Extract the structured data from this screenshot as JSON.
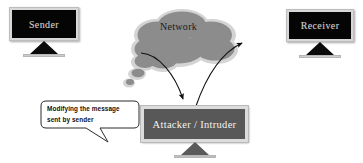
{
  "diagram": {
    "background_color": "#ffffff",
    "nodes": {
      "sender": {
        "label": "Sender",
        "type": "computer-monitor",
        "screen_color": "#050505",
        "bezel_color": "#d8d8d8",
        "text_color": "#cfcfcf"
      },
      "receiver": {
        "label": "Receiver",
        "type": "computer-monitor",
        "screen_color": "#050505",
        "bezel_color": "#d8d8d8",
        "text_color": "#cfcfcf"
      },
      "network": {
        "label": "Network",
        "type": "cloud",
        "fill_color": "#8c8c8c",
        "outline_color": "#d2d2d2",
        "text_color": "#1b1b1b"
      },
      "attacker": {
        "label": "Attacker / Intruder",
        "type": "computer-monitor",
        "screen_color": "#585858",
        "bezel_color": "#dcdcdc",
        "text_color": "#f2f2f2"
      }
    },
    "callout": {
      "line_1": "Modifying the message",
      "line_2": "sent by sender",
      "fill_color": "#ffffff",
      "outline_color": "#2b2b2b",
      "text_color": "#111111"
    },
    "arrows": [
      {
        "name": "network-to-attacker",
        "from": "network",
        "to": "attacker",
        "style": "curved-arrow",
        "color": "#111111"
      },
      {
        "name": "attacker-to-network",
        "from": "attacker",
        "to": "network",
        "style": "curved-arrow",
        "color": "#111111"
      }
    ]
  }
}
